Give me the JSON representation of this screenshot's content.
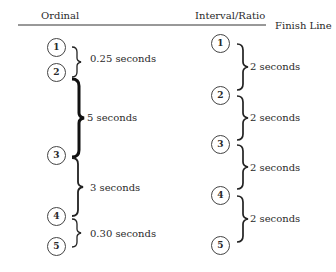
{
  "headers": {
    "ordinal": "Ordinal",
    "interval_ratio": "Interval/Ratio",
    "finish_line": "Finish Line"
  },
  "ordinal": {
    "runners": [
      {
        "label": "1",
        "x": 47,
        "y": 38
      },
      {
        "label": "2",
        "x": 47,
        "y": 63
      },
      {
        "label": "3",
        "x": 47,
        "y": 145
      },
      {
        "label": "4",
        "x": 47,
        "y": 206
      },
      {
        "label": "5",
        "x": 47,
        "y": 237
      }
    ],
    "gaps": [
      {
        "label": "0.25 seconds",
        "x": 90,
        "y": 53
      },
      {
        "label": "5 seconds",
        "x": 90,
        "y": 108
      },
      {
        "label": "3 seconds",
        "x": 90,
        "y": 182
      },
      {
        "label": "0.30 seconds",
        "x": 90,
        "y": 229
      }
    ]
  },
  "interval_ratio": {
    "runners": [
      {
        "label": "1",
        "x": 212,
        "y": 34
      },
      {
        "label": "2",
        "x": 212,
        "y": 86
      },
      {
        "label": "3",
        "x": 212,
        "y": 134
      },
      {
        "label": "4",
        "x": 212,
        "y": 185
      },
      {
        "label": "5",
        "x": 212,
        "y": 236
      }
    ],
    "gaps": [
      {
        "label": "2 seconds",
        "x": 250,
        "y": 61
      },
      {
        "label": "2 seconds",
        "x": 250,
        "y": 112
      },
      {
        "label": "2 seconds",
        "x": 250,
        "y": 161
      },
      {
        "label": "2 seconds",
        "x": 250,
        "y": 213
      }
    ]
  }
}
